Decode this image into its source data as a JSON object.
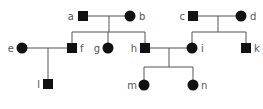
{
  "diagram": {
    "type": "pedigree",
    "colors": {
      "affected_fill": "#111111",
      "line": "#555555",
      "label": "#555555",
      "background": "#ffffff"
    },
    "individuals": [
      {
        "id": "a",
        "label": "a",
        "sex": "male",
        "affected": true,
        "generation": 1,
        "x": 83,
        "y": 16,
        "label_side": "left"
      },
      {
        "id": "b",
        "label": "b",
        "sex": "female",
        "affected": true,
        "generation": 1,
        "x": 130,
        "y": 16,
        "label_side": "right"
      },
      {
        "id": "c",
        "label": "c",
        "sex": "male",
        "affected": true,
        "generation": 1,
        "x": 193,
        "y": 16,
        "label_side": "left"
      },
      {
        "id": "d",
        "label": "d",
        "sex": "female",
        "affected": true,
        "generation": 1,
        "x": 241,
        "y": 16,
        "label_side": "right"
      },
      {
        "id": "e",
        "label": "e",
        "sex": "female",
        "affected": true,
        "generation": 2,
        "x": 22,
        "y": 48,
        "label_side": "left"
      },
      {
        "id": "f",
        "label": "f",
        "sex": "male",
        "affected": true,
        "generation": 2,
        "x": 72,
        "y": 48,
        "label_side": "right"
      },
      {
        "id": "g",
        "label": "g",
        "sex": "female",
        "affected": true,
        "generation": 2,
        "x": 108,
        "y": 48,
        "label_side": "left"
      },
      {
        "id": "h",
        "label": "h",
        "sex": "male",
        "affected": true,
        "generation": 2,
        "x": 145,
        "y": 48,
        "label_side": "left"
      },
      {
        "id": "i",
        "label": "i",
        "sex": "female",
        "affected": true,
        "generation": 2,
        "x": 192,
        "y": 48,
        "label_side": "right"
      },
      {
        "id": "k",
        "label": "k",
        "sex": "male",
        "affected": true,
        "generation": 2,
        "x": 246,
        "y": 48,
        "label_side": "right"
      },
      {
        "id": "l",
        "label": "l",
        "sex": "male",
        "affected": true,
        "generation": 3,
        "x": 48,
        "y": 84,
        "label_side": "left"
      },
      {
        "id": "m",
        "label": "m",
        "sex": "female",
        "affected": true,
        "generation": 3,
        "x": 144,
        "y": 85,
        "label_side": "left"
      },
      {
        "id": "n",
        "label": "n",
        "sex": "female",
        "affected": true,
        "generation": 3,
        "x": 193,
        "y": 85,
        "label_side": "right"
      }
    ],
    "marriages": [
      {
        "partners": [
          "a",
          "b"
        ],
        "children": [
          "f",
          "g",
          "h"
        ]
      },
      {
        "partners": [
          "c",
          "d"
        ],
        "children": [
          "i",
          "k"
        ]
      },
      {
        "partners": [
          "e",
          "f"
        ],
        "children": [
          "l"
        ]
      },
      {
        "partners": [
          "h",
          "i"
        ],
        "children": [
          "m",
          "n"
        ]
      }
    ]
  }
}
